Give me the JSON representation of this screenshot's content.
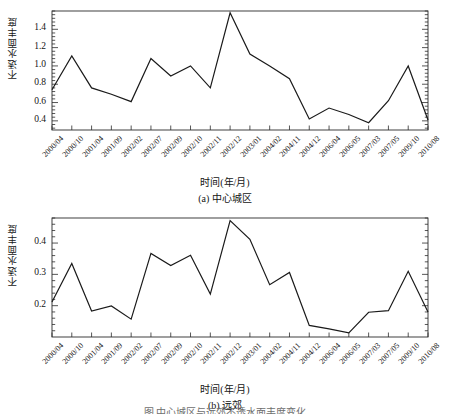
{
  "figure": {
    "caption": "图     中心城区与远郊不透水面丰度变化"
  },
  "chart_data": [
    {
      "type": "line",
      "panel_id": "a",
      "panel_caption": "(a) 中心城区",
      "title": "",
      "xlabel": "时间(年/月)",
      "ylabel": "不透水面丰度",
      "grid": false,
      "legend": "none",
      "ylim": [
        0.3,
        1.6
      ],
      "yticks": [
        0.4,
        0.6,
        0.8,
        1.0,
        1.2,
        1.4
      ],
      "ytick_labels": [
        "0.4",
        "0.6",
        "0.8",
        "1.0",
        "1.2",
        "1.4"
      ],
      "categories": [
        "2000/04",
        "2000/10",
        "2001/04",
        "2001/09",
        "2002/02",
        "2002/07",
        "2002/09",
        "2002/10",
        "2002/11",
        "2002/12",
        "2003/01",
        "2004/02",
        "2004/11",
        "2004/12",
        "2006/04",
        "2006/05",
        "2007/03",
        "2007/05",
        "2009/10",
        "2010/08"
      ],
      "values": [
        0.74,
        1.11,
        0.76,
        0.69,
        0.61,
        1.08,
        0.89,
        1.0,
        0.76,
        1.58,
        1.13,
        1.0,
        0.86,
        0.42,
        0.54,
        0.47,
        0.38,
        0.62,
        1.0,
        0.41
      ],
      "line_color": "#1a1a1a",
      "line_width": 1.2
    },
    {
      "type": "line",
      "panel_id": "b",
      "panel_caption": "(b) 远郊",
      "title": "",
      "xlabel": "时间(年/月)",
      "ylabel": "不透水面丰度",
      "grid": false,
      "legend": "none",
      "ylim": [
        0.1,
        0.48
      ],
      "yticks": [
        0.2,
        0.3,
        0.4
      ],
      "ytick_labels": [
        "0.2",
        "0.3",
        "0.4"
      ],
      "categories": [
        "2000/04",
        "2000/10",
        "2001/04",
        "2001/09",
        "2002/02",
        "2002/07",
        "2002/09",
        "2002/10",
        "2002/11",
        "2002/12",
        "2003/01",
        "2004/02",
        "2004/11",
        "2004/12",
        "2006/04",
        "2006/05",
        "2007/03",
        "2007/05",
        "2009/10",
        "2010/08"
      ],
      "values": [
        0.212,
        0.335,
        0.183,
        0.199,
        0.157,
        0.367,
        0.328,
        0.361,
        0.237,
        0.472,
        0.412,
        0.267,
        0.306,
        0.137,
        0.126,
        0.113,
        0.179,
        0.184,
        0.31,
        0.18
      ],
      "line_color": "#1a1a1a",
      "line_width": 1.2
    }
  ]
}
